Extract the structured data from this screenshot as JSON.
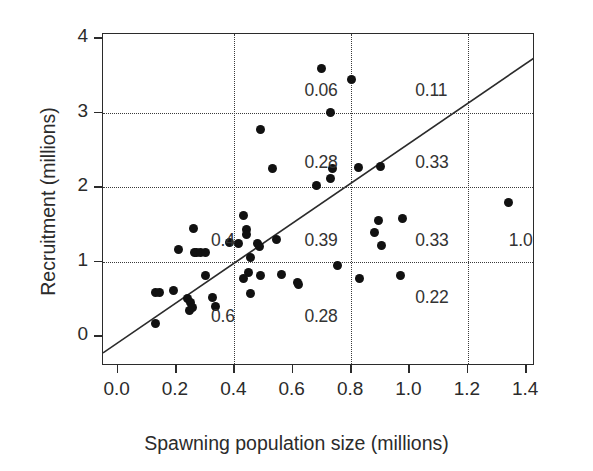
{
  "chart_data": {
    "type": "scatter",
    "title": "",
    "xlabel": "Spawning population size (millions)",
    "ylabel": "Recruitment (millions)",
    "xlim": [
      -0.05,
      1.43
    ],
    "ylim": [
      -0.4,
      4.06
    ],
    "xticks": [
      "0.0",
      "0.2",
      "0.4",
      "0.6",
      "0.8",
      "1.0",
      "1.2",
      "1.4"
    ],
    "xtick_values": [
      0.0,
      0.2,
      0.4,
      0.6,
      0.8,
      1.0,
      1.2,
      1.4
    ],
    "yticks": [
      "0",
      "1",
      "2",
      "3",
      "4"
    ],
    "ytick_values": [
      0,
      1,
      2,
      3,
      4
    ],
    "grid": true,
    "gridlines_x": [
      0.4,
      0.8,
      1.2
    ],
    "gridlines_y": [
      1,
      2,
      3
    ],
    "legend": "none",
    "marker_color": "#111111",
    "line_color": "#2b2b2b",
    "series": [
      {
        "name": "stock-recruitment observations",
        "points": [
          [
            0.13,
            0.17
          ],
          [
            0.13,
            0.59
          ],
          [
            0.145,
            0.59
          ],
          [
            0.19,
            0.61
          ],
          [
            0.21,
            1.16
          ],
          [
            0.24,
            0.51
          ],
          [
            0.245,
            0.34
          ],
          [
            0.25,
            0.45
          ],
          [
            0.255,
            0.39
          ],
          [
            0.26,
            1.45
          ],
          [
            0.265,
            1.13
          ],
          [
            0.27,
            1.12
          ],
          [
            0.285,
            1.13
          ],
          [
            0.3,
            1.13
          ],
          [
            0.3,
            0.81
          ],
          [
            0.325,
            0.52
          ],
          [
            0.335,
            0.4
          ],
          [
            0.385,
            1.26
          ],
          [
            0.43,
            1.62
          ],
          [
            0.44,
            1.43
          ],
          [
            0.44,
            1.36
          ],
          [
            0.415,
            1.25
          ],
          [
            0.48,
            1.25
          ],
          [
            0.455,
            1.06
          ],
          [
            0.485,
            1.21
          ],
          [
            0.45,
            0.85
          ],
          [
            0.43,
            0.78
          ],
          [
            0.455,
            0.58
          ],
          [
            0.49,
            0.82
          ],
          [
            0.49,
            2.78
          ],
          [
            0.53,
            2.25
          ],
          [
            0.545,
            1.3
          ],
          [
            0.56,
            0.83
          ],
          [
            0.615,
            0.72
          ],
          [
            0.62,
            0.69
          ],
          [
            0.68,
            2.02
          ],
          [
            0.7,
            3.6
          ],
          [
            0.73,
            3.0
          ],
          [
            0.735,
            2.25
          ],
          [
            0.73,
            2.12
          ],
          [
            0.755,
            0.95
          ],
          [
            0.8,
            3.45
          ],
          [
            0.825,
            2.27
          ],
          [
            0.83,
            0.77
          ],
          [
            0.88,
            1.4
          ],
          [
            0.895,
            1.55
          ],
          [
            0.9,
            2.28
          ],
          [
            0.905,
            1.22
          ],
          [
            0.97,
            0.81
          ],
          [
            0.975,
            1.58
          ],
          [
            1.34,
            1.8
          ]
        ]
      }
    ],
    "reference_line": {
      "name": "replacement line",
      "x0": -0.05,
      "y0": -0.25,
      "x1": 1.435,
      "y1": 3.74
    },
    "cell_annotations": [
      {
        "label": "0.06",
        "x": 0.64,
        "y": 3.3
      },
      {
        "label": "0.11",
        "x": 1.02,
        "y": 3.3
      },
      {
        "label": "0.28",
        "x": 0.64,
        "y": 2.33
      },
      {
        "label": "0.33",
        "x": 1.02,
        "y": 2.33
      },
      {
        "label": "0.4",
        "x": 0.32,
        "y": 1.28
      },
      {
        "label": "0.39",
        "x": 0.64,
        "y": 1.28
      },
      {
        "label": "0.33",
        "x": 1.02,
        "y": 1.28
      },
      {
        "label": "1.0",
        "x": 1.34,
        "y": 1.28
      },
      {
        "label": "0.6",
        "x": 0.32,
        "y": 0.26
      },
      {
        "label": "0.28",
        "x": 0.64,
        "y": 0.26
      },
      {
        "label": "0.22",
        "x": 1.02,
        "y": 0.52
      }
    ]
  }
}
